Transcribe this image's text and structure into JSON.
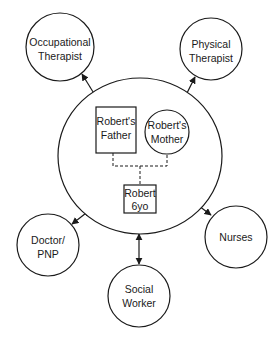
{
  "diagram": {
    "nodes": {
      "occupational_therapist": {
        "line1": "Occupational",
        "line2": "Therapist"
      },
      "physical_therapist": {
        "line1": "Physical",
        "line2": "Therapist"
      },
      "doctor_pnp": {
        "line1": "Doctor/",
        "line2": "PNP"
      },
      "social_worker": {
        "line1": "Social",
        "line2": "Worker"
      },
      "nurses": {
        "line1": "Nurses"
      },
      "family": {
        "father": {
          "line1": "Robert's",
          "line2": "Father"
        },
        "mother": {
          "line1": "Robert's",
          "line2": "Mother"
        },
        "child": {
          "line1": "Robert",
          "line2": "6yo"
        }
      }
    },
    "edges": [
      {
        "from": "occupational_therapist",
        "to": "family",
        "type": "bidirectional-arrow"
      },
      {
        "from": "physical_therapist",
        "to": "family",
        "type": "bidirectional-arrow"
      },
      {
        "from": "doctor_pnp",
        "to": "family",
        "type": "bidirectional-arrow"
      },
      {
        "from": "social_worker",
        "to": "family",
        "type": "bidirectional-arrow"
      },
      {
        "from": "nurses",
        "to": "family",
        "type": "bidirectional-arrow"
      },
      {
        "from": "father",
        "to": "child",
        "type": "dashed"
      },
      {
        "from": "mother",
        "to": "child",
        "type": "dashed"
      }
    ],
    "colors": {
      "stroke": "#1a1a1a",
      "background": "#ffffff"
    }
  }
}
